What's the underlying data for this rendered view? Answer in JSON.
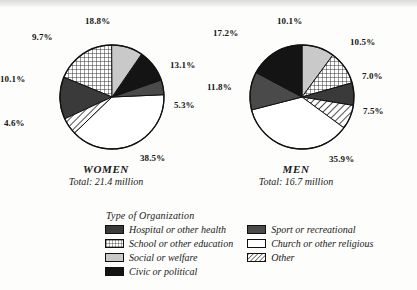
{
  "figure": {
    "legend_title": "Type of Organization"
  },
  "chart_data": [
    {
      "type": "pie",
      "title": "WOMEN",
      "subtitle": "Total: 21.4 million",
      "total": "21.4 million",
      "categories": [
        "School or other education",
        "Hospital or other health",
        "Other",
        "Church or other religious",
        "Sport or recreational",
        "Civic or political",
        "Social or welfare"
      ],
      "values": [
        18.8,
        13.1,
        5.3,
        38.5,
        4.6,
        10.1,
        9.7
      ],
      "labels": [
        "18.8%",
        "13.1%",
        "5.3%",
        "38.5%",
        "4.6%",
        "10.1%",
        "9.7%"
      ],
      "xlabel": "",
      "ylabel": "",
      "grid": false,
      "legend": "bottom-center"
    },
    {
      "type": "pie",
      "title": "MEN",
      "subtitle": "Total: 16.7 million",
      "total": "16.7 million",
      "categories": [
        "Social or welfare",
        "School or other education",
        "Hospital or other health",
        "Other",
        "Church or other religious",
        "Sport or recreational",
        "Civic or political"
      ],
      "values": [
        10.1,
        10.5,
        7.0,
        7.5,
        35.9,
        11.8,
        17.2
      ],
      "labels": [
        "10.1%",
        "10.5%",
        "7.0%",
        "7.5%",
        "35.9%",
        "11.8%",
        "17.2%"
      ],
      "xlabel": "",
      "ylabel": "",
      "grid": false,
      "legend": "bottom-center"
    }
  ],
  "legend": {
    "title": "Type of Organization",
    "columns": [
      {
        "items": [
          {
            "label": "Hospital or other health",
            "pattern": "solid-dark",
            "swatch_class": "sw-hospital"
          },
          {
            "label": "School or other education",
            "pattern": "grid",
            "swatch_class": "sw-school"
          },
          {
            "label": "Social or welfare",
            "pattern": "solid-light-gray",
            "swatch_class": "sw-social"
          },
          {
            "label": "Civic or political",
            "pattern": "solid-black",
            "swatch_class": "sw-civic"
          }
        ]
      },
      {
        "items": [
          {
            "label": "Sport or recreational",
            "pattern": "solid-mid-gray",
            "swatch_class": "sw-sport"
          },
          {
            "label": "Church or other religious",
            "pattern": "white",
            "swatch_class": "sw-church"
          },
          {
            "label": "Other",
            "pattern": "diagonal-hatch",
            "swatch_class": "sw-other"
          }
        ]
      }
    ]
  },
  "women_labels": {
    "school": "18.8%",
    "hospital": "13.1%",
    "other": "5.3%",
    "church": "38.5%",
    "sport": "4.6%",
    "civic": "10.1%",
    "social": "9.7%"
  },
  "men_labels": {
    "social": "10.1%",
    "school": "10.5%",
    "hospital": "7.0%",
    "other": "7.5%",
    "church": "35.9%",
    "sport": "11.8%",
    "civic": "17.2%"
  },
  "colors": {
    "hospital": "#3a3a3a",
    "social": "#c9c9c9",
    "civic": "#141414",
    "sport": "#4a4a4a",
    "church": "#ffffff",
    "stroke": "#111111",
    "text": "#161616"
  }
}
